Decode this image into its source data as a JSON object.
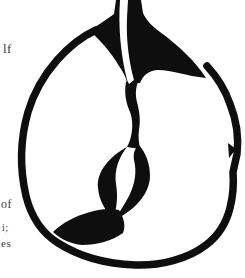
{
  "page": {
    "background": "#ffffff",
    "ink_color": "#0e0e0e",
    "text_color": "#3c3c3c"
  },
  "text_fragments": [
    {
      "text": "lf"
    },
    {
      "text": "of"
    },
    {
      "text": "i;"
    },
    {
      "text": "es"
    }
  ],
  "illustration": {
    "name": "apple-ink-drawing"
  }
}
